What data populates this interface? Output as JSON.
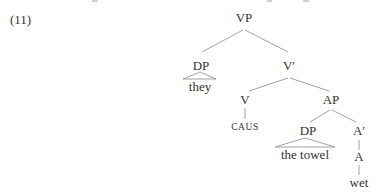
{
  "example_number": "(11)",
  "top_fragment": "",
  "tree": {
    "root": "VP",
    "nodes": {
      "vp": "VP",
      "dp_subject": "DP",
      "they": "they",
      "v_bar": "V′",
      "v": "V",
      "caus": "CAUS",
      "ap": "AP",
      "dp_object": "DP",
      "the_towel": "the towel",
      "a_bar": "A′",
      "a": "A",
      "wet": "wet"
    }
  }
}
